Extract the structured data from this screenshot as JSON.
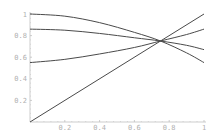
{
  "chart_data": {
    "type": "line",
    "title": "",
    "xlabel": "",
    "ylabel": "",
    "xlim": [
      0,
      1
    ],
    "ylim": [
      0,
      1
    ],
    "grid": false,
    "legend": null,
    "x_ticks": [
      "0.2",
      "0.4",
      "0.6",
      "0.8",
      "1"
    ],
    "y_ticks": [
      "0.2",
      "0.4",
      "0.6",
      "0.8",
      "1"
    ],
    "x_tick_values": [
      0.2,
      0.4,
      0.6,
      0.8,
      1
    ],
    "y_tick_values": [
      0.2,
      0.4,
      0.6,
      0.8,
      1
    ],
    "annotations": [
      "All four curves intersect at approximately (0.75, 0.75)"
    ],
    "series": [
      {
        "name": "curve-1",
        "x": [
          0,
          0.2,
          0.4,
          0.6,
          0.75,
          0.9,
          1
        ],
        "values": [
          1.0,
          0.98,
          0.92,
          0.83,
          0.75,
          0.64,
          0.55
        ]
      },
      {
        "name": "curve-2",
        "x": [
          0,
          0.2,
          0.4,
          0.6,
          0.75,
          0.9,
          1
        ],
        "values": [
          0.86,
          0.85,
          0.82,
          0.78,
          0.75,
          0.71,
          0.67
        ]
      },
      {
        "name": "curve-3",
        "x": [
          0,
          0.2,
          0.4,
          0.6,
          0.75,
          0.9,
          1
        ],
        "values": [
          0.55,
          0.58,
          0.63,
          0.69,
          0.75,
          0.81,
          0.86
        ]
      },
      {
        "name": "line-y-equals-x",
        "x": [
          0,
          1
        ],
        "values": [
          0,
          1
        ]
      }
    ]
  },
  "style": {
    "line_color": "#4a4a4a",
    "axis_color": "#c0c0c0",
    "label_color": "#b0b0b0"
  }
}
